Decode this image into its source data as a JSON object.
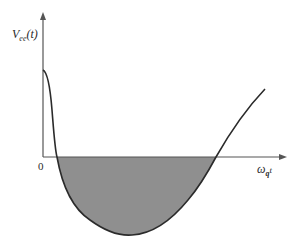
{
  "diagram": {
    "y_axis_label": "V",
    "y_axis_label_sub": "ee",
    "y_axis_label_arg": "(t)",
    "x_axis_label": "ω",
    "x_axis_label_sub": "q",
    "x_axis_label_var": "t",
    "origin_label": "0",
    "colors": {
      "axis": "#555555",
      "curve": "#2b2b2b",
      "fill": "#8f8f8f"
    }
  }
}
